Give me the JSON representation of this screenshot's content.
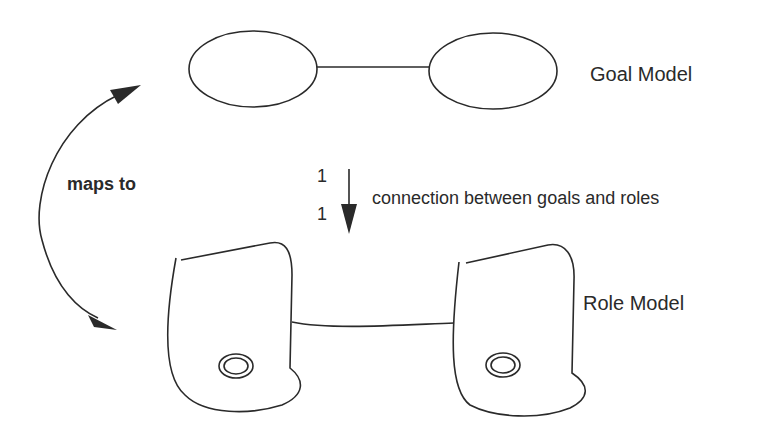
{
  "diagram": {
    "goal_model": {
      "label": "Goal Model",
      "nodes": [
        {
          "shape": "ellipse",
          "cx": 253,
          "cy": 68,
          "rx": 64,
          "ry": 38
        },
        {
          "shape": "ellipse",
          "cx": 493,
          "cy": 70,
          "rx": 64,
          "ry": 38
        }
      ],
      "edges": [
        {
          "from": 0,
          "to": 1
        }
      ]
    },
    "role_model": {
      "label": "Role Model",
      "nodes": [
        {
          "shape": "role-blob",
          "has_double_circle": true
        },
        {
          "shape": "role-blob",
          "has_double_circle": true
        }
      ],
      "edges": [
        {
          "from": 0,
          "to": 1
        }
      ]
    },
    "mapping_arrow": {
      "label": "maps to",
      "type": "bidirectional-curved"
    },
    "connection_arrow": {
      "label": "connection between goals and roles",
      "multiplicity_top": "1",
      "multiplicity_bottom": "1",
      "direction": "down"
    },
    "colors": {
      "stroke": "#2a2a2a",
      "background": "#ffffff"
    }
  }
}
